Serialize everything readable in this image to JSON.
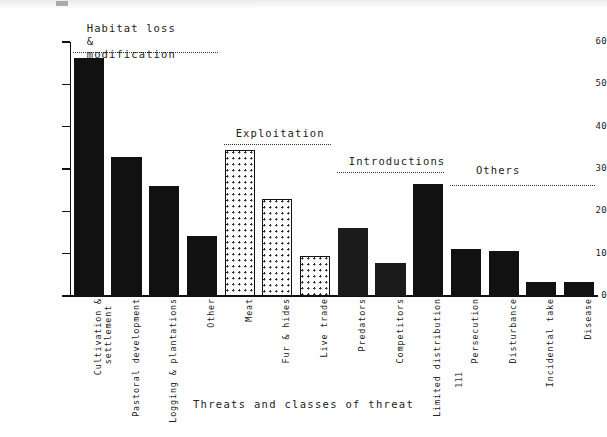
{
  "figure": {
    "x_axis_title": "Threats and classes of threat",
    "y_axis_title": "Per cent of species affected",
    "edge_mark": "111"
  },
  "axis": {
    "y_ticks": [
      "0",
      "10",
      "20",
      "30",
      "40",
      "50",
      "60"
    ]
  },
  "groups": [
    {
      "name": "habitat-loss",
      "label": "Habitat loss &\nmodification"
    },
    {
      "name": "exploitation",
      "label": "Exploitation"
    },
    {
      "name": "introductions",
      "label": "Introductions"
    },
    {
      "name": "others",
      "label": "Others"
    }
  ],
  "chart_data": {
    "type": "bar",
    "title": "",
    "xlabel": "Threats and classes of threat",
    "ylabel": "Per cent of species affected",
    "ylim": [
      0,
      60
    ],
    "yticks": [
      0,
      10,
      20,
      30,
      40,
      50,
      60
    ],
    "grid": false,
    "legend": "none",
    "group_labels": [
      "Habitat loss & modification",
      "Exploitation",
      "Introductions",
      "Others"
    ],
    "categories": [
      "Cultivation & settlement",
      "Pastoral development",
      "Logging & plantations",
      "Other",
      "Meat",
      "Fur & hides",
      "Live trade",
      "Predators",
      "Competitors",
      "Limited distribution",
      "Persecution",
      "Disturbance",
      "Incidental take",
      "Disease"
    ],
    "values": [
      56.2,
      32.8,
      26.0,
      14.2,
      34.5,
      22.8,
      9.5,
      16.0,
      7.9,
      26.5,
      11.1,
      10.7,
      3.2,
      3.2
    ],
    "groups": [
      "Habitat loss & modification",
      "Habitat loss & modification",
      "Habitat loss & modification",
      "Habitat loss & modification",
      "Exploitation",
      "Exploitation",
      "Exploitation",
      "Introductions",
      "Introductions",
      "Others",
      "Others",
      "Others",
      "Others",
      "Others"
    ],
    "fills": [
      "solid",
      "solid",
      "solid",
      "solid",
      "dotted",
      "dotted",
      "dotted",
      "dark",
      "dark",
      "solid",
      "solid",
      "solid",
      "solid",
      "solid"
    ]
  },
  "bars": [
    {
      "name": "cultivation-settlement",
      "label_line1": "Cultivation &",
      "label_line2": "settlement",
      "value": 56.2,
      "fill": "solid"
    },
    {
      "name": "pastoral-development",
      "label_line1": "Pastoral development",
      "label_line2": "",
      "value": 32.8,
      "fill": "solid"
    },
    {
      "name": "logging-plantations",
      "label_line1": "Logging & plantations",
      "label_line2": "",
      "value": 26.0,
      "fill": "solid"
    },
    {
      "name": "other",
      "label_line1": "Other",
      "label_line2": "",
      "value": 14.2,
      "fill": "solid"
    },
    {
      "name": "meat",
      "label_line1": "Meat",
      "label_line2": "",
      "value": 34.5,
      "fill": "dotted"
    },
    {
      "name": "fur-hides",
      "label_line1": "Fur & hides",
      "label_line2": "",
      "value": 22.8,
      "fill": "dotted"
    },
    {
      "name": "live-trade",
      "label_line1": "Live trade",
      "label_line2": "",
      "value": 9.5,
      "fill": "dotted"
    },
    {
      "name": "predators",
      "label_line1": "Predators",
      "label_line2": "",
      "value": 16.0,
      "fill": "dark"
    },
    {
      "name": "competitors",
      "label_line1": "Competitors",
      "label_line2": "",
      "value": 7.9,
      "fill": "dark"
    },
    {
      "name": "limited-distribution",
      "label_line1": "Limited distribution",
      "label_line2": "",
      "value": 26.5,
      "fill": "solid"
    },
    {
      "name": "persecution",
      "label_line1": "Persecution",
      "label_line2": "",
      "value": 11.1,
      "fill": "solid"
    },
    {
      "name": "disturbance",
      "label_line1": "Disturbance",
      "label_line2": "",
      "value": 10.7,
      "fill": "solid"
    },
    {
      "name": "incidental-take",
      "label_line1": "Incidental take",
      "label_line2": "",
      "value": 3.2,
      "fill": "solid"
    },
    {
      "name": "disease",
      "label_line1": "Disease",
      "label_line2": "",
      "value": 3.2,
      "fill": "solid"
    }
  ]
}
